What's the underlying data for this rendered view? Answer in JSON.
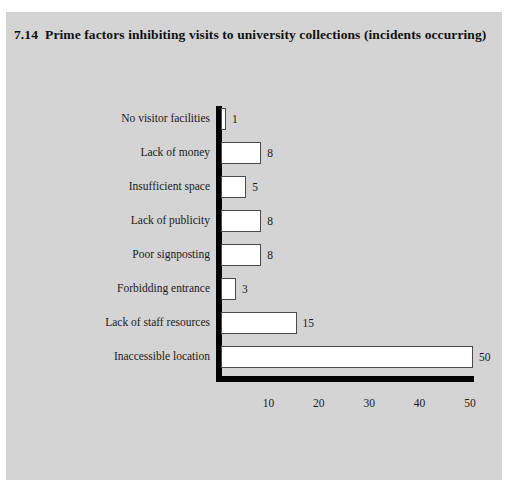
{
  "figure": {
    "number": "7.14",
    "title": "Prime factors inhibiting visits to university collections (incidents occurring)",
    "panel_color": "#d4d4d4",
    "page_color": "#ffffff",
    "bar_fill": "#ffffff",
    "bar_border": "#4a4a4a",
    "axis_color": "#000000"
  },
  "chart_data": {
    "type": "bar",
    "orientation": "horizontal",
    "xlabel": "",
    "ylabel": "",
    "categories": [
      "No visitor facilities",
      "Lack of money",
      "Insufficient space",
      "Lack of publicity",
      "Poor signposting",
      "Forbidding entrance",
      "Lack of staff resources",
      "Inaccessible location"
    ],
    "values": [
      1,
      8,
      5,
      8,
      8,
      3,
      15,
      50
    ],
    "value_labels": [
      "1",
      "8",
      "5",
      "8",
      "8",
      "3",
      "15",
      "50"
    ],
    "xlim": [
      0,
      50
    ],
    "xticks": [
      10,
      20,
      30,
      40,
      50
    ],
    "xtick_labels": [
      "10",
      "20",
      "30",
      "40",
      "50"
    ],
    "grid": false,
    "legend": false,
    "data_labels": true,
    "series": [
      {
        "name": "incidents occurring",
        "values": [
          1,
          8,
          5,
          8,
          8,
          3,
          15,
          50
        ]
      }
    ]
  }
}
